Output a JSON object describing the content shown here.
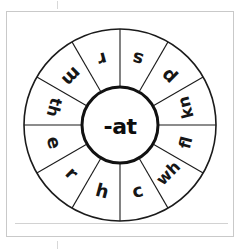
{
  "worksheet": {
    "type": "word-family-wheel",
    "center_label": "-at",
    "segment_count": 12,
    "colors": {
      "ink": "#161616",
      "outline": "#1b1b1b",
      "hub_outline": "#111111",
      "page_frame": "#c9c9c9",
      "paper": "#ffffff",
      "rule": "#d2d2d2"
    },
    "segments": [
      {
        "label": "r",
        "angle_deg": 345
      },
      {
        "label": "s",
        "angle_deg": 15
      },
      {
        "label": "p",
        "angle_deg": 45
      },
      {
        "label": "kn",
        "angle_deg": 75
      },
      {
        "label": "fl",
        "angle_deg": 105
      },
      {
        "label": "wh",
        "angle_deg": 135
      },
      {
        "label": "c",
        "angle_deg": 165
      },
      {
        "label": "h",
        "angle_deg": 195
      },
      {
        "label": "r",
        "angle_deg": 225
      },
      {
        "label": "e",
        "angle_deg": 255
      },
      {
        "label": "th",
        "angle_deg": 285
      },
      {
        "label": "m",
        "angle_deg": 315
      }
    ],
    "words": [
      "rat",
      "sat",
      "pat",
      "knat",
      "flat",
      "what",
      "cat",
      "hat",
      "rat",
      "eat",
      "that",
      "mat"
    ]
  }
}
